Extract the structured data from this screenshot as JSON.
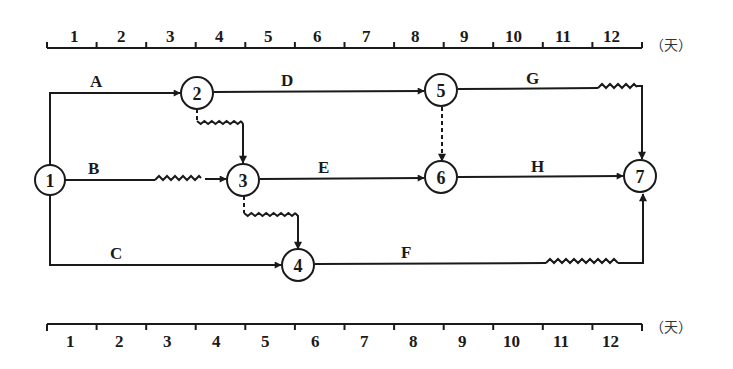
{
  "diagram": {
    "type": "time-scaled network diagram",
    "unit_label": "（天）",
    "top_scale": {
      "labels": [
        "1",
        "2",
        "3",
        "4",
        "5",
        "6",
        "7",
        "8",
        "9",
        "10",
        "11",
        "12"
      ]
    },
    "bottom_scale": {
      "labels": [
        "1",
        "2",
        "3",
        "4",
        "5",
        "6",
        "7",
        "8",
        "9",
        "10",
        "11",
        "12"
      ]
    },
    "nodes": [
      {
        "id": "1",
        "label": "1"
      },
      {
        "id": "2",
        "label": "2"
      },
      {
        "id": "3",
        "label": "3"
      },
      {
        "id": "4",
        "label": "4"
      },
      {
        "id": "5",
        "label": "5"
      },
      {
        "id": "6",
        "label": "6"
      },
      {
        "id": "7",
        "label": "7"
      }
    ],
    "activities": [
      {
        "label": "A",
        "from": "1",
        "to": "2",
        "duration": 3,
        "free_float": 0
      },
      {
        "label": "B",
        "from": "1",
        "to": "3",
        "duration": 2,
        "free_float": 2
      },
      {
        "label": "C",
        "from": "1",
        "to": "4",
        "duration": 5,
        "free_float": 0
      },
      {
        "label": "D",
        "from": "2",
        "to": "5",
        "duration": 5,
        "free_float": 0
      },
      {
        "label": "E",
        "from": "3",
        "to": "6",
        "duration": 4,
        "free_float": 0
      },
      {
        "label": "F",
        "from": "4",
        "to": "7",
        "duration": 5,
        "free_float": 2
      },
      {
        "label": "G",
        "from": "5",
        "to": "7",
        "duration": 3,
        "free_float": 1
      },
      {
        "label": "H",
        "from": "6",
        "to": "7",
        "duration": 4,
        "free_float": 0
      }
    ],
    "dummies": [
      {
        "from": "2",
        "to": "3",
        "free_float": 1
      },
      {
        "from": "3",
        "to": "4",
        "free_float": 1
      },
      {
        "from": "5",
        "to": "6",
        "free_float": 0
      }
    ]
  }
}
